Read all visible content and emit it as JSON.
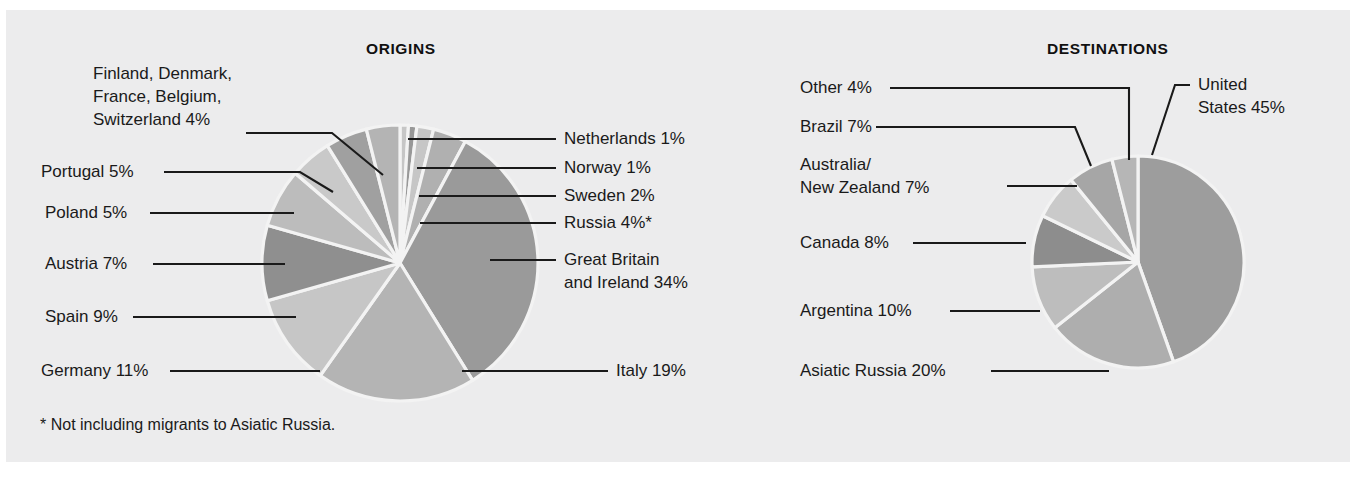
{
  "figure": {
    "background_color": "#ececed",
    "footnote": "* Not including migrants to Asiatic Russia."
  },
  "origins": {
    "title": "ORIGINS",
    "labels": {
      "nordic_group": "Finland, Denmark,\nFrance, Belgium,\nSwitzerland  4%",
      "nordic_group_l1": "Finland, Denmark,",
      "nordic_group_l2": "France, Belgium,",
      "nordic_group_l3": "Switzerland  4%",
      "portugal": "Portugal  5%",
      "poland": "Poland  5%",
      "austria": "Austria  7%",
      "spain": "Spain  9%",
      "germany": "Germany  11%",
      "netherlands": "Netherlands  1%",
      "norway": "Norway  1%",
      "sweden": "Sweden  2%",
      "russia": "Russia  4%*",
      "great_britain_l1": "Great Britain",
      "great_britain_l2": "and Ireland  34%",
      "italy": "Italy  19%"
    }
  },
  "destinations": {
    "title": "DESTINATIONS",
    "labels": {
      "other": "Other  4%",
      "brazil": "Brazil 7%",
      "australia_nz_l1": "Australia/",
      "australia_nz_l2": "New Zealand  7%",
      "canada": "Canada  8%",
      "argentina": "Argentina  10%",
      "asiatic_russia": "Asiatic Russia  20%",
      "united_states_l1": "United",
      "united_states_l2": "States 45%"
    }
  },
  "chart_data": [
    {
      "type": "pie",
      "title": "ORIGINS",
      "id": "origins",
      "unit": "percent",
      "start_angle_deg": 0,
      "direction": "clockwise",
      "center": [
        400,
        263
      ],
      "radius": 138,
      "categories": [
        "Netherlands",
        "Norway",
        "Sweden",
        "Russia",
        "Great Britain and Ireland",
        "Italy",
        "Germany",
        "Spain",
        "Austria",
        "Poland",
        "Portugal",
        "Finland, Denmark, France, Belgium, Switzerland"
      ],
      "values": [
        1,
        1,
        2,
        4,
        34,
        19,
        11,
        9,
        7,
        5,
        5,
        4
      ],
      "colors": [
        "#c6c6c6",
        "#989898",
        "#c6c6c6",
        "#b0b0b0",
        "#9a9a9a",
        "#b4b4b4",
        "#c6c6c6",
        "#8f8f8f",
        "#bcbcbc",
        "#c9c9c9",
        "#a0a0a0",
        "#b4b4b4"
      ],
      "legend": "callout-leader-lines",
      "annotations": [
        "* Not including migrants to Asiatic Russia."
      ]
    },
    {
      "type": "pie",
      "title": "DESTINATIONS",
      "id": "destinations",
      "unit": "percent",
      "start_angle_deg": 0,
      "direction": "clockwise",
      "center": [
        1138,
        262
      ],
      "radius": 106,
      "categories": [
        "United States",
        "Asiatic Russia",
        "Argentina",
        "Canada",
        "Australia/New Zealand",
        "Brazil",
        "Other"
      ],
      "values": [
        45,
        20,
        10,
        8,
        7,
        7,
        4
      ],
      "colors": [
        "#9d9d9d",
        "#aeaeae",
        "#bdbdbd",
        "#8d8d8d",
        "#cacaca",
        "#a6a6a6",
        "#b6b6b6"
      ],
      "legend": "callout-leader-lines"
    }
  ]
}
